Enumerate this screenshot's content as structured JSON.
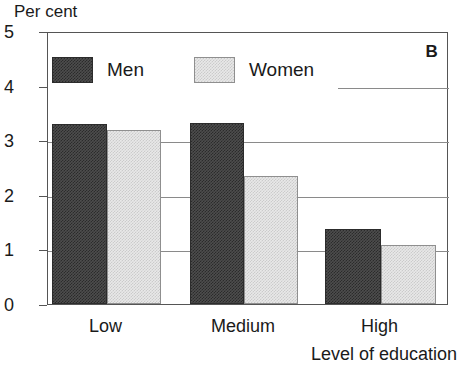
{
  "chart_data": {
    "type": "bar",
    "title": "",
    "panel_letter": "B",
    "ylabel": "Per cent",
    "xlabel": "Level of education",
    "categories": [
      "Low",
      "Medium",
      "High"
    ],
    "series": [
      {
        "name": "Men",
        "color": "#4d4d4d",
        "values": [
          3.3,
          3.32,
          1.37
        ]
      },
      {
        "name": "Women",
        "color": "#e8e8e8",
        "values": [
          3.18,
          2.34,
          1.09
        ]
      }
    ],
    "ylim": [
      0,
      5
    ],
    "yticks": [
      "0",
      "1",
      "2",
      "3",
      "4",
      "5"
    ],
    "ytick_values": [
      0,
      1,
      2,
      3,
      4,
      5
    ],
    "grid": "horizontal",
    "legend_position": "top-left-inside"
  },
  "legend": {
    "men_label": "Men",
    "women_label": "Women"
  }
}
